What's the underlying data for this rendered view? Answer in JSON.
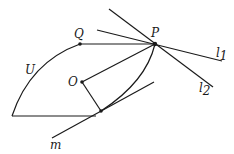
{
  "figure": {
    "type": "geometry-diagram",
    "points": {
      "P": {
        "label": "P",
        "x": 155,
        "y": 44
      },
      "Q": {
        "label": "Q",
        "x": 80,
        "y": 44
      },
      "O": {
        "label": "O",
        "x": 82,
        "y": 82
      },
      "T": {
        "label": "",
        "x": 101,
        "y": 111
      }
    },
    "curve_label": "U",
    "lines": {
      "l1": {
        "label": "l",
        "subscript": "1"
      },
      "l2": {
        "label": "l",
        "subscript": "2"
      },
      "m": {
        "label": "m"
      }
    },
    "colors": {
      "ink": "#1a1a1a",
      "background": "#ffffff"
    }
  }
}
